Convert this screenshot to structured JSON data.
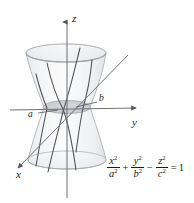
{
  "figure": {
    "axes": [
      {
        "name": "z-axis",
        "label": "z"
      },
      {
        "name": "y-axis",
        "label": "y"
      },
      {
        "name": "x-axis",
        "label": "x"
      }
    ],
    "annotations": [
      {
        "name": "semi-axis-a",
        "label": "a"
      },
      {
        "name": "semi-axis-b",
        "label": "b"
      }
    ],
    "equation": {
      "term1_num_var": "x",
      "term1_num_exp": "2",
      "term1_den_var": "a",
      "term1_den_exp": "2",
      "op1": "+",
      "term2_num_var": "y",
      "term2_num_exp": "2",
      "term2_den_var": "b",
      "term2_den_exp": "2",
      "op2": "−",
      "term3_num_var": "z",
      "term3_num_exp": "2",
      "term3_den_var": "c",
      "term3_den_exp": "2",
      "equals": "=",
      "rhs": "1"
    },
    "colors": {
      "background": "#ffffff",
      "axis": "#6f6f77",
      "curve": "#4a4a52",
      "surface_fill": "#e9ebec",
      "surface_edge": "#b9bdc0",
      "waist_fill": "#c9ccd0",
      "text": "#1a1a1a"
    }
  }
}
